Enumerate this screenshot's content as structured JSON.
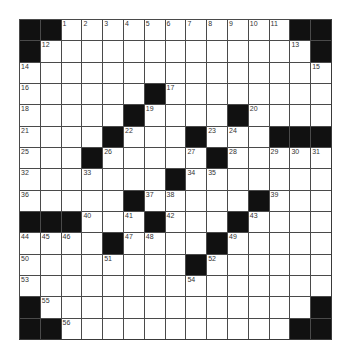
{
  "puzzle": {
    "rows": 15,
    "cols": 15,
    "colors": {
      "block": "#111111",
      "cell": "#ffffff",
      "grid_line": "#4a4a4a",
      "number": "#333333"
    },
    "layout": [
      "##...........##",
      "#.............#",
      "...............",
      "......#........",
      ".....#....#....",
      "....#...#...###",
      "...#.....#.....",
      ".......#.......",
      ".....#.....#...",
      "###...#...#....",
      "....#....#.....",
      "........#......",
      "...............",
      "#.............#",
      "##...........##"
    ],
    "numbers": [
      {
        "n": 1,
        "r": 0,
        "c": 2
      },
      {
        "n": 2,
        "r": 0,
        "c": 3
      },
      {
        "n": 3,
        "r": 0,
        "c": 4
      },
      {
        "n": 4,
        "r": 0,
        "c": 5
      },
      {
        "n": 5,
        "r": 0,
        "c": 6
      },
      {
        "n": 6,
        "r": 0,
        "c": 7
      },
      {
        "n": 7,
        "r": 0,
        "c": 8
      },
      {
        "n": 8,
        "r": 0,
        "c": 9
      },
      {
        "n": 9,
        "r": 0,
        "c": 10
      },
      {
        "n": 10,
        "r": 0,
        "c": 11
      },
      {
        "n": 11,
        "r": 0,
        "c": 12
      },
      {
        "n": 12,
        "r": 1,
        "c": 1
      },
      {
        "n": 13,
        "r": 1,
        "c": 13
      },
      {
        "n": 14,
        "r": 2,
        "c": 0
      },
      {
        "n": 15,
        "r": 2,
        "c": 14
      },
      {
        "n": 16,
        "r": 3,
        "c": 0
      },
      {
        "n": 17,
        "r": 3,
        "c": 7
      },
      {
        "n": 18,
        "r": 4,
        "c": 0
      },
      {
        "n": 19,
        "r": 4,
        "c": 6
      },
      {
        "n": 20,
        "r": 4,
        "c": 11
      },
      {
        "n": 21,
        "r": 5,
        "c": 0
      },
      {
        "n": 22,
        "r": 5,
        "c": 5
      },
      {
        "n": 23,
        "r": 5,
        "c": 9
      },
      {
        "n": 24,
        "r": 5,
        "c": 10
      },
      {
        "n": 25,
        "r": 6,
        "c": 0
      },
      {
        "n": 26,
        "r": 6,
        "c": 4
      },
      {
        "n": 27,
        "r": 6,
        "c": 8
      },
      {
        "n": 28,
        "r": 6,
        "c": 10
      },
      {
        "n": 29,
        "r": 6,
        "c": 12
      },
      {
        "n": 30,
        "r": 6,
        "c": 13
      },
      {
        "n": 31,
        "r": 6,
        "c": 14
      },
      {
        "n": 32,
        "r": 7,
        "c": 0
      },
      {
        "n": 33,
        "r": 7,
        "c": 3
      },
      {
        "n": 34,
        "r": 7,
        "c": 8
      },
      {
        "n": 35,
        "r": 7,
        "c": 9
      },
      {
        "n": 36,
        "r": 8,
        "c": 0
      },
      {
        "n": 37,
        "r": 8,
        "c": 6
      },
      {
        "n": 38,
        "r": 8,
        "c": 7
      },
      {
        "n": 39,
        "r": 8,
        "c": 12
      },
      {
        "n": 40,
        "r": 9,
        "c": 3
      },
      {
        "n": 41,
        "r": 9,
        "c": 5
      },
      {
        "n": 42,
        "r": 9,
        "c": 7
      },
      {
        "n": 43,
        "r": 9,
        "c": 11
      },
      {
        "n": 44,
        "r": 10,
        "c": 0
      },
      {
        "n": 45,
        "r": 10,
        "c": 1
      },
      {
        "n": 46,
        "r": 10,
        "c": 2
      },
      {
        "n": 47,
        "r": 10,
        "c": 5
      },
      {
        "n": 48,
        "r": 10,
        "c": 6
      },
      {
        "n": 49,
        "r": 10,
        "c": 10
      },
      {
        "n": 50,
        "r": 11,
        "c": 0
      },
      {
        "n": 51,
        "r": 11,
        "c": 4
      },
      {
        "n": 52,
        "r": 11,
        "c": 9
      },
      {
        "n": 53,
        "r": 12,
        "c": 0
      },
      {
        "n": 54,
        "r": 12,
        "c": 8
      },
      {
        "n": 55,
        "r": 13,
        "c": 1
      },
      {
        "n": 56,
        "r": 14,
        "c": 2
      }
    ]
  }
}
